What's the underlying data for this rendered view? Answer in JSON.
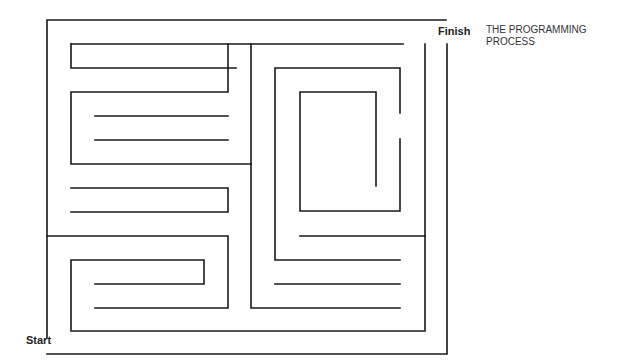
{
  "labels": {
    "finish": "Finish",
    "start": "Start",
    "title_line1": "THE PROGRAMMING",
    "title_line2": "PROCESS"
  },
  "colors": {
    "line": "#1a1a1a",
    "background": "#ffffff"
  },
  "maze_paths": [
    "M47,338 L47,20 L446,20",
    "M425,44 L425,331 L71,331 L71,260 L204,260 L204,284 L95,284",
    "M95,308 L228,308 L228,236 L47,236",
    "M447,44 L447,354 L47,354",
    "M71,44 L71,68 L236,68",
    "M71,44 L251,44 L251,308 L400,308",
    "M251,44 L403,44",
    "M228,44 L228,92 L71,92 L71,164 L251,164",
    "M95,116 L228,116",
    "M95,140 L228,140",
    "M71,188 L228,188 L228,212 L71,212",
    "M275,284 L400,284",
    "M400,260 L275,260 L275,68 L400,68 L400,113",
    "M400,139 L400,211 L300,211 L300,92 L376,92 L376,186",
    "M300,236 L425,236"
  ]
}
